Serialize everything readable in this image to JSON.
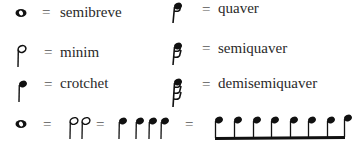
{
  "equals_sign": "=",
  "note_values": [
    {
      "id": "semibreve",
      "icon": "semibreve-note-icon",
      "label": "semibreve"
    },
    {
      "id": "minim",
      "icon": "minim-note-icon",
      "label": "minim"
    },
    {
      "id": "crotchet",
      "icon": "crotchet-note-icon",
      "label": "crotchet"
    },
    {
      "id": "quaver",
      "icon": "quaver-note-icon",
      "label": "quaver"
    },
    {
      "id": "semiquaver",
      "icon": "semiquaver-note-icon",
      "label": "semiquaver"
    },
    {
      "id": "demisemiquaver",
      "icon": "demisemiquaver-note-icon",
      "label": "demisemiquaver"
    }
  ],
  "equivalence": {
    "semibreves": 1,
    "minims": 2,
    "crotchets": 4,
    "beamed_quavers": 8
  },
  "colors": {
    "ink": "#111111",
    "text": "#2a2a2a"
  }
}
